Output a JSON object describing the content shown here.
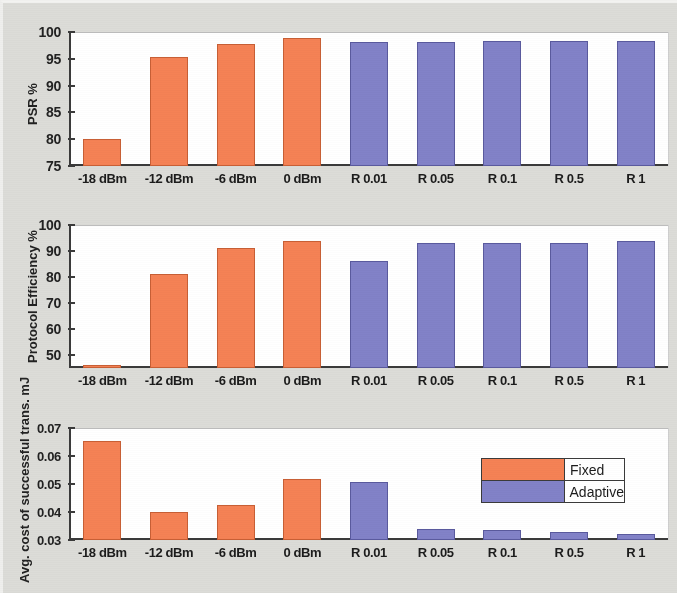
{
  "figure": {
    "background_color": "#dcdcd8",
    "plot_background_color": "#ffffff",
    "axis_color": "#3a3a3a"
  },
  "legend": {
    "position": "inside-panel-3-upper-right",
    "entries": [
      {
        "label": "Fixed",
        "color": "#f58255"
      },
      {
        "label": "Adaptive",
        "color": "#8282c8"
      }
    ]
  },
  "chart_data": [
    {
      "type": "bar",
      "title": "",
      "xlabel": "",
      "ylabel": "PSR %",
      "ylim": [
        75,
        100
      ],
      "yticks": [
        75,
        80,
        85,
        90,
        95,
        100
      ],
      "ytick_labels": [
        "75",
        "80",
        "85",
        "90",
        "95",
        "100"
      ],
      "grid": false,
      "categories": [
        "-18 dBm",
        "-12 dBm",
        "-6 dBm",
        "0 dBm",
        "R 0.01",
        "R 0.05",
        "R 0.1",
        "R 0.5",
        "R 1"
      ],
      "series": [
        {
          "name": "Fixed",
          "color": "#f58255",
          "values": [
            80.1,
            95.3,
            97.8,
            98.8,
            null,
            null,
            null,
            null,
            null
          ]
        },
        {
          "name": "Adaptive",
          "color": "#8282c8",
          "values": [
            null,
            null,
            null,
            null,
            98.1,
            98.2,
            98.3,
            98.3,
            98.3
          ]
        }
      ]
    },
    {
      "type": "bar",
      "title": "",
      "xlabel": "",
      "ylabel": "Protocol Efficiency %",
      "ylim": [
        45,
        100
      ],
      "yticks": [
        50,
        60,
        70,
        80,
        90,
        100
      ],
      "ytick_labels": [
        "50",
        "60",
        "70",
        "80",
        "90",
        "100"
      ],
      "grid": false,
      "categories": [
        "-18 dBm",
        "-12 dBm",
        "-6 dBm",
        "0 dBm",
        "R 0.01",
        "R 0.05",
        "R 0.1",
        "R 0.5",
        "R 1"
      ],
      "series": [
        {
          "name": "Fixed",
          "color": "#f58255",
          "values": [
            46.0,
            81.0,
            91.0,
            94.0,
            null,
            null,
            null,
            null,
            null
          ]
        },
        {
          "name": "Adaptive",
          "color": "#8282c8",
          "values": [
            null,
            null,
            null,
            null,
            86.0,
            93.0,
            93.0,
            93.2,
            94.0
          ]
        }
      ]
    },
    {
      "type": "bar",
      "title": "",
      "xlabel": "",
      "ylabel": "Avg. cost of successful trans. mJ",
      "ylim": [
        0.03,
        0.07
      ],
      "yticks": [
        0.03,
        0.04,
        0.05,
        0.06,
        0.07
      ],
      "ytick_labels": [
        "0.03",
        "0.04",
        "0.05",
        "0.06",
        "0.07"
      ],
      "grid": false,
      "categories": [
        "-18 dBm",
        "-12 dBm",
        "-6 dBm",
        "0 dBm",
        "R 0.01",
        "R 0.05",
        "R 0.1",
        "R 0.5",
        "R 1"
      ],
      "series": [
        {
          "name": "Fixed",
          "color": "#f58255",
          "values": [
            0.0655,
            0.04,
            0.0425,
            0.0518,
            null,
            null,
            null,
            null,
            null
          ]
        },
        {
          "name": "Adaptive",
          "color": "#8282c8",
          "values": [
            null,
            null,
            null,
            null,
            0.0508,
            0.034,
            0.0335,
            0.0327,
            0.0322
          ]
        }
      ]
    }
  ]
}
